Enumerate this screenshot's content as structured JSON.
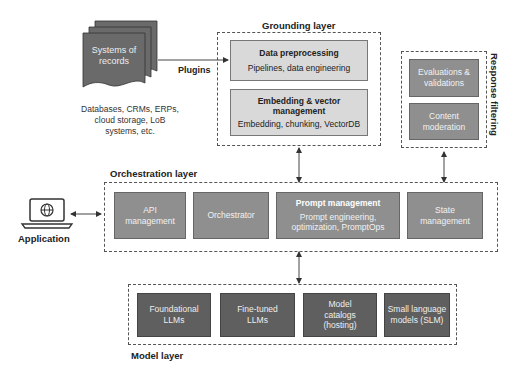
{
  "systems_of_records": {
    "label": "Systems of records",
    "note_lines": [
      "Databases, CRMs, ERPs,",
      "cloud storage, LoB",
      "systems, etc."
    ],
    "connector_label": "Plugins"
  },
  "grounding_layer": {
    "title": "Grounding layer",
    "boxes": [
      {
        "title": "Data preprocessing",
        "subtitle": "Pipelines, data engineering"
      },
      {
        "title": "Embedding & vector management",
        "subtitle": "Embedding, chunking, VectorDB"
      }
    ]
  },
  "response_filtering": {
    "title": "Response filtering",
    "boxes": [
      {
        "label": "Evaluations & validations"
      },
      {
        "label": "Content moderation"
      }
    ]
  },
  "application": {
    "label": "Application",
    "icon": "laptop-globe-icon"
  },
  "orchestration_layer": {
    "title": "Orchestration layer",
    "boxes": [
      {
        "label": "API management"
      },
      {
        "label": "Orchestrator"
      },
      {
        "title": "Prompt management",
        "subtitle": "Prompt engineering, optimization, PromptOps"
      },
      {
        "label": "State management"
      }
    ]
  },
  "model_layer": {
    "title": "Model layer",
    "boxes": [
      {
        "label": "Foundational LLMs"
      },
      {
        "label": "Fine-tuned LLMs"
      },
      {
        "label": "Model catalogs (hosting)"
      },
      {
        "label": "Small language models (SLM)"
      }
    ]
  },
  "colors": {
    "light_box": "#d9d9d9",
    "mid_box": "#8f8f8f",
    "dark_box": "#5f5f5f",
    "dashed_border": "#555555"
  }
}
